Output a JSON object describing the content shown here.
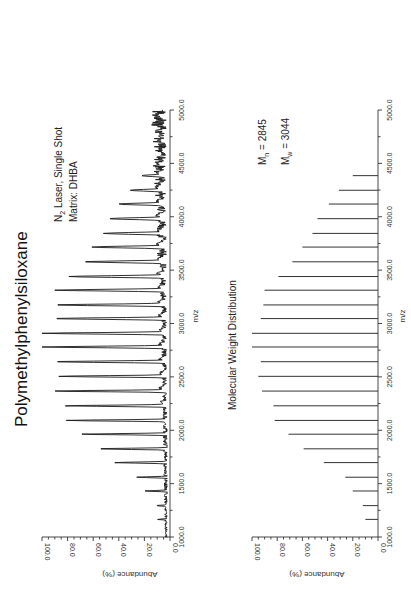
{
  "chart_data": [
    {
      "type": "line",
      "title": "Polymethylphenylsiloxane",
      "annotations": [
        "N2 Laser, Single Shot",
        "Matrix: DHBA"
      ],
      "xlabel": "m/z",
      "ylabel": "Abundance (%)",
      "xlim": [
        1000.0,
        5000.0
      ],
      "ylim": [
        0.0,
        100.0
      ],
      "x_ticks": [
        "1000.0",
        "1500.0",
        "2000.0",
        "2500.0",
        "3000.0",
        "3500.0",
        "4000.0",
        "4500.0",
        "5000.0"
      ],
      "y_ticks": [
        "0.0",
        "20.0",
        "40.0",
        "60.0",
        "80.0",
        "100.0"
      ],
      "orientation": "rotated 90 degrees counter-clockwise",
      "peaks": {
        "mz": [
          1165,
          1294,
          1431,
          1560,
          1697,
          1826,
          1963,
          2092,
          2229,
          2367,
          2505,
          2642,
          2780,
          2908,
          3046,
          3174,
          3312,
          3440,
          3578,
          3716,
          3844,
          3982,
          4119,
          4248,
          4385
        ],
        "abundance": [
          10,
          11,
          20,
          26,
          44,
          58,
          70,
          81,
          83,
          91,
          88,
          92,
          100,
          100,
          92,
          91,
          90,
          79,
          68,
          61,
          52,
          48,
          40,
          31,
          22
        ]
      },
      "baseline_noise_pct": [
        3,
        15
      ]
    },
    {
      "type": "bar",
      "title": "Molecular Weight Distribution",
      "annotations": [
        "Mn = 2845",
        "Mw = 3044"
      ],
      "xlabel": "m/z",
      "ylabel": "Abundance (%)",
      "xlim": [
        1000.0,
        5000.0
      ],
      "ylim": [
        0.0,
        100.0
      ],
      "x_ticks": [
        "1000.0",
        "1500.0",
        "2000.0",
        "2500.0",
        "3000.0",
        "3500.0",
        "4000.0",
        "4500.0",
        "5000.0"
      ],
      "y_ticks": [
        "0.0",
        "20.0",
        "40.0",
        "60.0",
        "80.0",
        "100.0"
      ],
      "orientation": "rotated 90 degrees counter-clockwise",
      "x": [
        1165,
        1294,
        1431,
        1560,
        1697,
        1826,
        1963,
        2092,
        2229,
        2367,
        2505,
        2642,
        2780,
        2908,
        3046,
        3174,
        3312,
        3440,
        3578,
        3716,
        3844,
        3982,
        4119,
        4248,
        4385
      ],
      "values": [
        10,
        12,
        20,
        26,
        43,
        59,
        71,
        82,
        83,
        92,
        95,
        93,
        100,
        100,
        93,
        91,
        90,
        79,
        68,
        60,
        52,
        48,
        39,
        31,
        20
      ]
    }
  ],
  "labels": {
    "title": "Polymethylphenylsiloxane",
    "laser_prefix": "N",
    "laser_sub": "2",
    "laser_rest": " Laser, Single Shot",
    "matrix": "Matrix: DHBA",
    "mwd_title": "Molecular Weight Distribution",
    "mn_prefix": "M",
    "mn_sub": "n",
    "mn_rest": " = 2845",
    "mw_prefix": "M",
    "mw_sub": "w",
    "mw_rest": " = 3044",
    "xlabel": "m/z",
    "ylabel": "Abundance (%)"
  },
  "colors": {
    "line": "#1a1a1a",
    "axis": "#333333",
    "background": "#ffffff"
  }
}
